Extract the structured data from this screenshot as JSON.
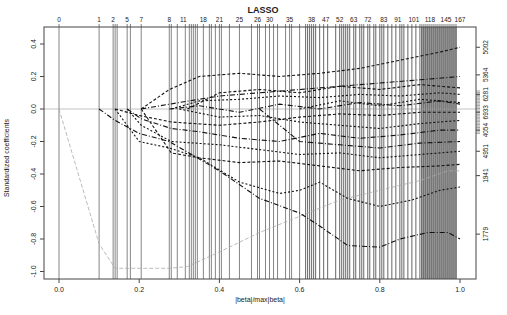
{
  "chart_data": {
    "type": "line",
    "title": "LASSO",
    "xlabel": "|beta|/max|beta|",
    "ylabel": "Standardized coefficients",
    "xlim": [
      -0.04,
      1.04
    ],
    "ylim": [
      -1.04,
      0.44
    ],
    "x_ticks": [
      0.0,
      0.2,
      0.4,
      0.6,
      0.8,
      1.0
    ],
    "x_tick_labels": [
      "0.0",
      "0.2",
      "0.4",
      "0.6",
      "0.8",
      "1.0"
    ],
    "y_ticks": [
      0.4,
      0.2,
      0.0,
      -0.2,
      -0.4,
      -0.6,
      -0.8,
      -1.0
    ],
    "y_tick_labels": [
      "0.4",
      "0.2",
      "0.0",
      "-0.2",
      "-0.4",
      "-0.6",
      "-0.8",
      "-1.0"
    ],
    "top_axis_label_positions": [
      0.0,
      0.1,
      0.14,
      0.175,
      0.205,
      0.275,
      0.315,
      0.365,
      0.4,
      0.45,
      0.495,
      0.525,
      0.575,
      0.63,
      0.665,
      0.7,
      0.74,
      0.775,
      0.815,
      0.85,
      0.89,
      0.935,
      0.975
    ],
    "top_axis_labels": [
      "0",
      "1",
      "2",
      "5",
      "7",
      "8",
      "11",
      "18",
      "21",
      "25",
      "26",
      "30",
      "35",
      "38",
      "47",
      "52",
      "63",
      "72",
      "83",
      "91",
      "101",
      "118",
      "145",
      "167"
    ],
    "right_axis_labels": [
      {
        "label": "5002",
        "y": 0.38
      },
      {
        "label": "5364",
        "y": 0.21
      },
      {
        "label": "6281",
        "y": 0.09
      },
      {
        "label": "6933",
        "y": -0.02
      },
      {
        "label": "4054",
        "y": -0.13
      },
      {
        "label": "4951",
        "y": -0.26
      },
      {
        "label": "1941",
        "y": -0.41
      },
      {
        "label": "1779",
        "y": -0.77
      }
    ],
    "vertical_lines_step_positions": [
      0.0,
      0.1,
      0.135,
      0.14,
      0.145,
      0.17,
      0.178,
      0.205,
      0.275,
      0.28,
      0.295,
      0.315,
      0.325,
      0.33,
      0.335,
      0.34,
      0.345,
      0.36,
      0.375,
      0.38,
      0.39,
      0.4,
      0.405,
      0.425,
      0.45,
      0.48,
      0.495,
      0.5,
      0.515,
      0.525,
      0.535,
      0.545,
      0.565,
      0.575,
      0.58,
      0.6,
      0.615,
      0.62,
      0.625,
      0.63,
      0.635,
      0.64,
      0.65,
      0.66,
      0.67,
      0.69,
      0.7,
      0.705,
      0.71,
      0.715,
      0.72,
      0.725,
      0.735,
      0.74,
      0.75,
      0.755,
      0.76,
      0.77,
      0.775,
      0.785,
      0.79,
      0.8,
      0.805,
      0.81,
      0.82,
      0.83,
      0.84,
      0.85,
      0.855,
      0.86,
      0.87,
      0.88,
      0.89,
      0.9,
      0.905,
      0.91,
      0.915,
      0.92,
      0.925,
      0.93,
      0.935,
      0.94,
      0.945,
      0.95,
      0.955,
      0.96,
      0.965,
      0.97,
      0.975,
      0.98,
      0.985,
      0.99
    ],
    "series": [
      {
        "name": "1779",
        "x": [
          0.0,
          0.1,
          0.14,
          0.275,
          0.32,
          0.4,
          0.5,
          0.6,
          0.7,
          0.8,
          0.9,
          0.97,
          1.0
        ],
        "y": [
          0.0,
          -0.83,
          -0.98,
          -0.98,
          -0.97,
          -0.88,
          -0.76,
          -0.66,
          -0.56,
          -0.5,
          -0.44,
          -0.38,
          -0.38
        ]
      },
      {
        "name": "1941",
        "x": [
          0.1,
          0.14,
          0.2,
          0.275,
          0.4,
          0.5,
          0.6,
          0.65,
          0.72,
          0.8,
          0.85,
          0.92,
          0.97,
          1.0
        ],
        "y": [
          0.0,
          -0.07,
          -0.15,
          -0.2,
          -0.38,
          -0.55,
          -0.64,
          -0.72,
          -0.84,
          -0.85,
          -0.8,
          -0.76,
          -0.76,
          -0.8
        ]
      },
      {
        "name": "4951",
        "x": [
          0.14,
          0.2,
          0.275,
          0.35,
          0.45,
          0.55,
          0.6,
          0.65,
          0.72,
          0.8,
          0.88,
          0.95,
          1.0
        ],
        "y": [
          0.0,
          -0.2,
          -0.24,
          -0.3,
          -0.45,
          -0.52,
          -0.5,
          -0.45,
          -0.55,
          -0.6,
          -0.56,
          -0.5,
          -0.48
        ]
      },
      {
        "name": "5002",
        "x": [
          0.205,
          0.275,
          0.35,
          0.45,
          0.55,
          0.65,
          0.75,
          0.85,
          0.95,
          1.0
        ],
        "y": [
          0.0,
          0.12,
          0.2,
          0.22,
          0.2,
          0.22,
          0.25,
          0.3,
          0.35,
          0.38
        ]
      },
      {
        "name": "5364",
        "x": [
          0.205,
          0.3,
          0.4,
          0.5,
          0.6,
          0.7,
          0.8,
          0.9,
          1.0
        ],
        "y": [
          0.0,
          0.04,
          0.08,
          0.1,
          0.12,
          0.14,
          0.16,
          0.18,
          0.2
        ]
      },
      {
        "name": "6281",
        "x": [
          0.28,
          0.35,
          0.45,
          0.55,
          0.65,
          0.75,
          0.85,
          0.95,
          1.0
        ],
        "y": [
          0.0,
          0.05,
          0.06,
          0.08,
          0.07,
          0.09,
          0.08,
          0.1,
          0.09
        ]
      },
      {
        "name": "6933",
        "x": [
          0.14,
          0.2,
          0.28,
          0.4,
          0.5,
          0.6,
          0.7,
          0.8,
          0.9,
          1.0
        ],
        "y": [
          0.0,
          -0.04,
          -0.08,
          -0.1,
          -0.08,
          -0.05,
          -0.03,
          -0.04,
          -0.02,
          -0.02
        ]
      },
      {
        "name": "4054",
        "x": [
          0.17,
          0.205,
          0.28,
          0.35,
          0.45,
          0.55,
          0.65,
          0.75,
          0.85,
          0.95,
          1.0
        ],
        "y": [
          0.0,
          -0.06,
          -0.12,
          -0.14,
          -0.18,
          -0.2,
          -0.15,
          -0.18,
          -0.16,
          -0.13,
          -0.13
        ]
      },
      {
        "name": "s9",
        "x": [
          0.17,
          0.205,
          0.28,
          0.4,
          0.5,
          0.6,
          0.7,
          0.8,
          0.9,
          1.0
        ],
        "y": [
          0.0,
          -0.1,
          -0.2,
          -0.22,
          -0.25,
          -0.28,
          -0.27,
          -0.3,
          -0.28,
          -0.26
        ]
      },
      {
        "name": "s10",
        "x": [
          0.205,
          0.28,
          0.35,
          0.45,
          0.55,
          0.65,
          0.75,
          0.85,
          0.95,
          1.0
        ],
        "y": [
          0.0,
          -0.27,
          -0.3,
          -0.33,
          -0.32,
          -0.35,
          -0.38,
          -0.36,
          -0.35,
          -0.34
        ]
      },
      {
        "name": "s11",
        "x": [
          0.275,
          0.35,
          0.45,
          0.55,
          0.65,
          0.75,
          0.85,
          0.95,
          1.0
        ],
        "y": [
          0.0,
          0.02,
          -0.02,
          0.03,
          0.0,
          0.04,
          0.02,
          0.05,
          0.03
        ]
      },
      {
        "name": "s12",
        "x": [
          0.3,
          0.4,
          0.5,
          0.6,
          0.7,
          0.8,
          0.9,
          1.0
        ],
        "y": [
          0.0,
          -0.05,
          -0.04,
          -0.08,
          -0.1,
          -0.12,
          -0.09,
          -0.07
        ]
      },
      {
        "name": "s13",
        "x": [
          0.32,
          0.4,
          0.5,
          0.6,
          0.7,
          0.8,
          0.9,
          1.0
        ],
        "y": [
          0.0,
          0.1,
          0.12,
          0.1,
          0.14,
          0.12,
          0.15,
          0.13
        ]
      },
      {
        "name": "s14",
        "x": [
          0.5,
          0.6,
          0.7,
          0.8,
          0.9,
          1.0
        ],
        "y": [
          0.0,
          -0.2,
          -0.22,
          -0.24,
          -0.21,
          -0.2
        ]
      },
      {
        "name": "s15",
        "x": [
          0.6,
          0.7,
          0.8,
          0.9,
          1.0
        ],
        "y": [
          0.0,
          0.05,
          0.02,
          0.06,
          0.04
        ]
      }
    ],
    "grid": false,
    "legend": "none"
  }
}
